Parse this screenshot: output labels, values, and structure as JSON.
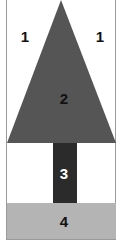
{
  "diagram": {
    "title": "",
    "regions": [
      {
        "id": "sky-left",
        "label": "1",
        "color": "#ffffff"
      },
      {
        "id": "sky-right",
        "label": "1",
        "color": "#ffffff"
      },
      {
        "id": "canopy",
        "label": "2",
        "color": "#555555"
      },
      {
        "id": "trunk",
        "label": "3",
        "color": "#2b2b2b"
      },
      {
        "id": "ground",
        "label": "4",
        "color": "#b4b4b4"
      }
    ]
  }
}
